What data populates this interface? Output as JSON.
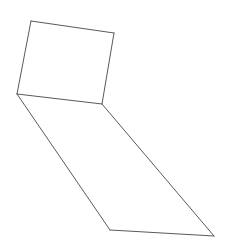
{
  "figure": {
    "kind": "line-drawing",
    "canvas": {
      "width": 231,
      "height": 244
    },
    "background_color": "#ffffff",
    "stroke_color": "#5a5a5a",
    "stroke_width": 1,
    "vertices": {
      "A": {
        "label": "top-left",
        "x": 31,
        "y": 21
      },
      "B": {
        "label": "top-right",
        "x": 114,
        "y": 33
      },
      "C": {
        "label": "mid-right",
        "x": 102,
        "y": 104
      },
      "D": {
        "label": "mid-left",
        "x": 17,
        "y": 94
      },
      "E": {
        "label": "bottom-left",
        "x": 110,
        "y": 230
      },
      "F": {
        "label": "bottom-right",
        "x": 214,
        "y": 236
      }
    },
    "faces": [
      {
        "name": "upper-quadrilateral",
        "points": "31,21 114,33 102,104 17,94",
        "vertex_keys": [
          "A",
          "B",
          "C",
          "D"
        ]
      },
      {
        "name": "lower-parallelogram",
        "points": "17,94 102,104 214,236 110,230",
        "vertex_keys": [
          "D",
          "C",
          "F",
          "E"
        ]
      }
    ],
    "edges": [
      {
        "name": "edge-top",
        "from": "A",
        "to": "B",
        "d": "M 31 21 L 114 33"
      },
      {
        "name": "edge-upper-right",
        "from": "B",
        "to": "C",
        "d": "M 114 33 L 102 104"
      },
      {
        "name": "edge-shared-middle",
        "from": "C",
        "to": "D",
        "d": "M 102 104 L 17 94"
      },
      {
        "name": "edge-upper-left",
        "from": "D",
        "to": "A",
        "d": "M 17 94 L 31 21"
      },
      {
        "name": "edge-lower-left",
        "from": "D",
        "to": "E",
        "d": "M 17 94 L 110 230"
      },
      {
        "name": "edge-bottom",
        "from": "E",
        "to": "F",
        "d": "M 110 230 L 214 236"
      },
      {
        "name": "edge-lower-right",
        "from": "F",
        "to": "C",
        "d": "M 214 236 L 102 104"
      }
    ]
  }
}
